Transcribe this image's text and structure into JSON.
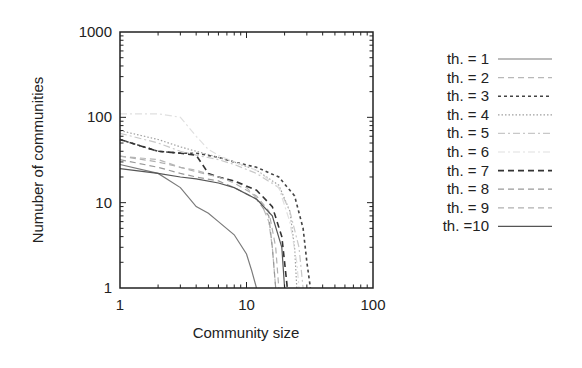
{
  "chart_data": {
    "type": "line",
    "title": "",
    "xlabel": "Community size",
    "ylabel": "Numuber of communities",
    "xscale": "log",
    "yscale": "log",
    "xlim": [
      1,
      100
    ],
    "ylim": [
      1,
      1000
    ],
    "xticks": [
      "1",
      "10",
      "100"
    ],
    "yticks": [
      "1",
      "10",
      "100",
      "1000"
    ],
    "grid": false,
    "legend_position": "right-outside",
    "series": [
      {
        "name": "th. = 1",
        "style": "solid",
        "color": "#7a7a7a",
        "x": [
          1,
          2,
          3,
          4,
          5,
          6,
          8,
          10,
          11,
          12
        ],
        "y": [
          28,
          22,
          15,
          9,
          7.5,
          6,
          4.2,
          2.5,
          1.6,
          1
        ]
      },
      {
        "name": "th. = 2",
        "style": "dashed",
        "color": "#b8b8b8",
        "x": [
          1,
          2,
          3,
          4,
          6,
          8,
          10,
          13,
          15,
          16,
          17
        ],
        "y": [
          35,
          32,
          26,
          24,
          20,
          18,
          15,
          10,
          6,
          3,
          1
        ]
      },
      {
        "name": "th. = 3",
        "style": "dotted",
        "color": "#444444",
        "x": [
          1,
          2,
          3,
          4,
          6,
          8,
          12,
          18,
          24,
          28,
          30,
          32
        ],
        "y": [
          55,
          40,
          38,
          38,
          34,
          30,
          26,
          20,
          12,
          5,
          2,
          1
        ]
      },
      {
        "name": "th. = 4",
        "style": "dotdot",
        "color": "#a0a0a0",
        "x": [
          1,
          2,
          3,
          4,
          6,
          8,
          12,
          18,
          22,
          24,
          25
        ],
        "y": [
          70,
          55,
          45,
          40,
          34,
          30,
          24,
          16,
          8,
          3,
          1
        ]
      },
      {
        "name": "th. = 5",
        "style": "dashdot",
        "color": "#c8c8c8",
        "x": [
          1,
          2,
          3,
          4,
          6,
          8,
          12,
          18,
          22,
          26,
          28
        ],
        "y": [
          65,
          50,
          40,
          36,
          32,
          28,
          22,
          15,
          8,
          3,
          1
        ]
      },
      {
        "name": "th. = 6",
        "style": "dashdot",
        "color": "#e0e0e0",
        "x": [
          1,
          2,
          3,
          4,
          5,
          6,
          8,
          12,
          18,
          22,
          25,
          26
        ],
        "y": [
          110,
          110,
          100,
          60,
          42,
          36,
          30,
          24,
          15,
          6,
          2,
          1
        ]
      },
      {
        "name": "th. = 7",
        "style": "dashed",
        "color": "#333333",
        "x": [
          1,
          2,
          3,
          4,
          5,
          6,
          8,
          12,
          16,
          19,
          20,
          21
        ],
        "y": [
          55,
          40,
          38,
          36,
          22,
          20,
          18,
          14,
          9,
          4,
          2,
          1
        ]
      },
      {
        "name": "th. = 8",
        "style": "dashed",
        "color": "#999999",
        "x": [
          1,
          2,
          3,
          4,
          6,
          8,
          12,
          15,
          16,
          17
        ],
        "y": [
          32,
          26,
          22,
          20,
          18,
          15,
          11,
          7,
          3,
          1
        ]
      },
      {
        "name": "th. = 9",
        "style": "dashed",
        "color": "#b0b0b0",
        "x": [
          1,
          2,
          3,
          4,
          6,
          8,
          12,
          15,
          17,
          18
        ],
        "y": [
          35,
          30,
          26,
          23,
          20,
          17,
          12,
          8,
          3,
          1
        ]
      },
      {
        "name": "th. =10",
        "style": "solid",
        "color": "#555555",
        "x": [
          1,
          2,
          3,
          4,
          6,
          8,
          12,
          16,
          19,
          20
        ],
        "y": [
          25,
          22,
          20,
          19,
          17,
          15,
          11,
          7,
          3,
          1
        ]
      }
    ]
  }
}
